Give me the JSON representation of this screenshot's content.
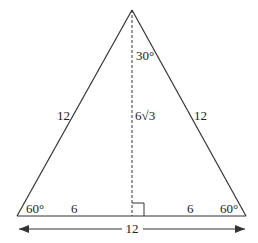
{
  "diagram": {
    "type": "equilateral-triangle-with-altitude",
    "colors": {
      "stroke": "#333333",
      "text": "#222222",
      "background": "#ffffff"
    },
    "labels": {
      "apex_angle": "30°",
      "altitude": "6√3",
      "left_side": "12",
      "right_side": "12",
      "left_base_angle": "60°",
      "right_base_angle": "60°",
      "left_half_base": "6",
      "right_half_base": "6",
      "base_length": "12"
    }
  }
}
